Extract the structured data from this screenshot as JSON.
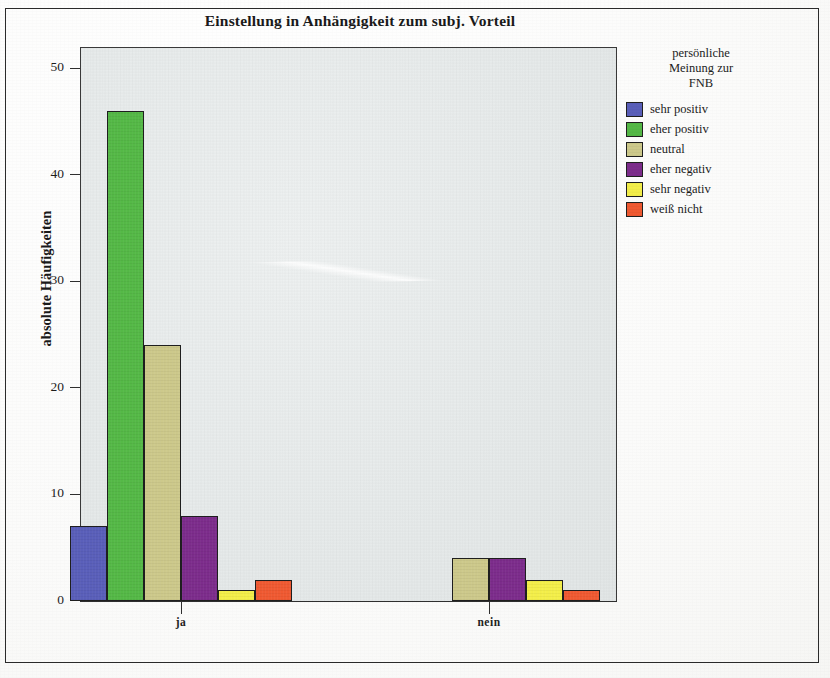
{
  "chart_data": {
    "type": "bar",
    "title": "Einstellung in Anhängigkeit zum subj. Vorteil",
    "xlabel": "",
    "ylabel": "absolute Häufigkeiten",
    "categories": [
      "ja",
      "nein"
    ],
    "ylim": [
      0,
      52
    ],
    "yticks": [
      0,
      10,
      20,
      30,
      40,
      50
    ],
    "grid": false,
    "legend_position": "right",
    "legend_title": "persönliche Meinung zur FNB",
    "legend_title_lines": [
      "persönliche",
      "Meinung zur",
      "FNB"
    ],
    "series": [
      {
        "name": "sehr positiv",
        "color": "#5a5fba",
        "values": [
          7,
          0
        ]
      },
      {
        "name": "eher positiv",
        "color": "#55b947",
        "values": [
          46,
          0
        ]
      },
      {
        "name": "neutral",
        "color": "#cdc98b",
        "values": [
          24,
          4
        ]
      },
      {
        "name": "eher negativ",
        "color": "#7d2d8c",
        "values": [
          8,
          4
        ]
      },
      {
        "name": "sehr negativ",
        "color": "#f4ef4a",
        "values": [
          1,
          2
        ]
      },
      {
        "name": "weiß nicht",
        "color": "#f05a32",
        "values": [
          2,
          1
        ]
      }
    ]
  },
  "axis": {
    "ytick_labels": [
      "0",
      "10",
      "20",
      "30",
      "40",
      "50"
    ],
    "xtick_labels": [
      "ja",
      "nein"
    ]
  }
}
